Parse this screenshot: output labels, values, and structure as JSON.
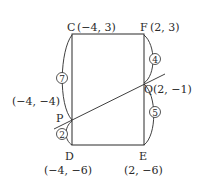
{
  "diagram": {
    "points": {
      "C": {
        "name": "C",
        "coord": "(−4, 3)"
      },
      "F": {
        "name": "F",
        "coord": "(2, 3)"
      },
      "D": {
        "name": "D",
        "coord": "(−4, −6)"
      },
      "E": {
        "name": "E",
        "coord": "(2, −6)"
      },
      "P": {
        "name": "P",
        "coord": "(−4, −4)"
      },
      "Q": {
        "name": "Q",
        "coord": "Q(2, −1)"
      }
    },
    "segment_ratios": {
      "CP": "7",
      "PD": "2",
      "FQ": "4",
      "QE": "5"
    },
    "colors": {
      "stroke": "#2a2a2a",
      "background": "#ffffff"
    }
  }
}
